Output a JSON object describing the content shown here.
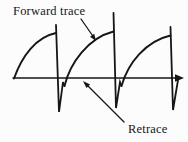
{
  "figure": {
    "background": "#fcfcfc",
    "ink_color": "#161616",
    "labels": {
      "forward_trace": "Forward trace",
      "retrace": "Retrace"
    },
    "waveform": {
      "type": "sawtooth-sweep",
      "cycles": 3,
      "description": "Three cycles of a CRT sweep waveform: slow concave forward trace rising from the time axis to a peak, fast vertical retrace dropping to a sharp spike below the axis, then returning to start the next cycle. Horizontal time axis with right arrowhead.",
      "paths": [
        {
          "name": "time-axis-line",
          "d": "M 13,78 L 179,78",
          "width": 1.4,
          "fill": false
        },
        {
          "name": "time-axis-arrowhead",
          "d": "M 184,78 L 175,74.2 L 175,81.8 Z",
          "width": 0,
          "fill": true
        },
        {
          "name": "forward-trace-1",
          "d": "M 14,78.5 C 22,56 36,37 56,33",
          "width": 1.9,
          "fill": false
        },
        {
          "name": "retrace-1",
          "d": "M 56,25 L 59,112 L 63,82 L 64.5,86",
          "width": 1.8,
          "fill": false
        },
        {
          "name": "forward-trace-2",
          "d": "M 64.5,86 C 70,63 88,38 113.5,31.5",
          "width": 1.9,
          "fill": false
        },
        {
          "name": "retrace-2",
          "d": "M 113.5,13 L 116,108 L 120,82 L 121.5,86",
          "width": 1.8,
          "fill": false
        },
        {
          "name": "forward-trace-3",
          "d": "M 121.5,86 C 128,63 146,41 170.5,35.5",
          "width": 1.9,
          "fill": false
        },
        {
          "name": "retrace-3",
          "d": "M 170.5,27 L 173,110 L 178,80",
          "width": 1.8,
          "fill": false
        },
        {
          "name": "forward-trace-callout-shaft",
          "d": "M 81,19 L 92.5,35.5",
          "width": 1.3,
          "fill": false
        },
        {
          "name": "forward-trace-callout-head",
          "d": "M 96,41 L 90,36.8 L 94.2,33.8 Z",
          "width": 0,
          "fill": true
        },
        {
          "name": "retrace-callout-shaft",
          "d": "M 124,122 L 87.5,85.5",
          "width": 1.3,
          "fill": false
        },
        {
          "name": "retrace-callout-head",
          "d": "M 83,81 L 90.1,84.5 L 86.5,88.1 Z",
          "width": 0,
          "fill": true
        }
      ]
    }
  }
}
